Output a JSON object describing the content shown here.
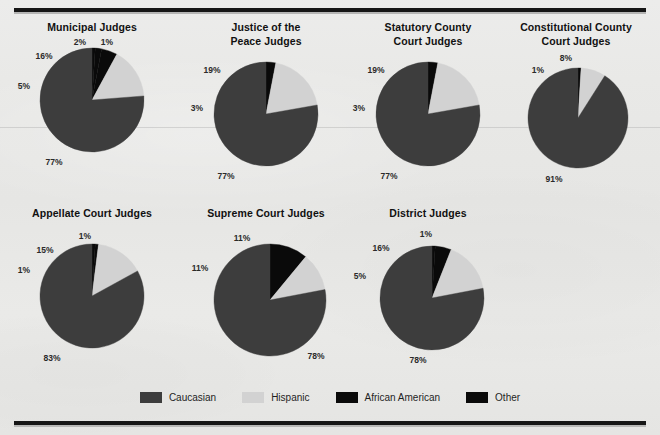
{
  "figure": {
    "background_color": "#e8e8e6",
    "rule_color": "#161616"
  },
  "legend": {
    "items": [
      {
        "label": "Caucasian",
        "color": "#3d3d3d"
      },
      {
        "label": "Hispanic",
        "color": "#d2d2d2"
      },
      {
        "label": "African American",
        "color": "#0a0a0a"
      },
      {
        "label": "Other",
        "color": "#0a0a0a"
      }
    ]
  },
  "chart_data": [
    {
      "type": "pie",
      "title": "Municipal Judges",
      "categories": [
        "Caucasian",
        "Hispanic",
        "African American",
        "Other"
      ],
      "values": [
        77,
        16,
        5,
        2
      ],
      "labels": [
        "77%",
        "16%",
        "5%",
        "2%",
        "1%"
      ],
      "colors": [
        "#3d3d3d",
        "#d2d2d2",
        "#0a0a0a",
        "#0a0a0a"
      ],
      "extra_slice": {
        "label": "1%",
        "value": 1,
        "category": "Other",
        "color": "#0a0a0a"
      }
    },
    {
      "type": "pie",
      "title": "Justice of the\nPeace Judges",
      "categories": [
        "Caucasian",
        "Hispanic",
        "African American"
      ],
      "values": [
        77,
        19,
        3
      ],
      "labels": [
        "77%",
        "19%",
        "3%"
      ],
      "colors": [
        "#3d3d3d",
        "#d2d2d2",
        "#0a0a0a"
      ]
    },
    {
      "type": "pie",
      "title": "Statutory County\nCourt Judges",
      "categories": [
        "Caucasian",
        "Hispanic",
        "African American"
      ],
      "values": [
        77,
        19,
        3
      ],
      "labels": [
        "77%",
        "19%",
        "3%"
      ],
      "colors": [
        "#3d3d3d",
        "#d2d2d2",
        "#0a0a0a"
      ]
    },
    {
      "type": "pie",
      "title": "Constitutional County\nCourt Judges",
      "categories": [
        "Caucasian",
        "Hispanic",
        "African American"
      ],
      "values": [
        91,
        8,
        1
      ],
      "labels": [
        "91%",
        "8%",
        "1%"
      ],
      "colors": [
        "#3d3d3d",
        "#d2d2d2",
        "#0a0a0a"
      ]
    },
    {
      "type": "pie",
      "title": "Appellate Court Judges",
      "categories": [
        "Caucasian",
        "Hispanic",
        "African American",
        "Other"
      ],
      "values": [
        83,
        15,
        1,
        1
      ],
      "labels": [
        "83%",
        "15%",
        "1%",
        "1%"
      ],
      "colors": [
        "#3d3d3d",
        "#d2d2d2",
        "#0a0a0a",
        "#0a0a0a"
      ]
    },
    {
      "type": "pie",
      "title": "Supreme Court Judges",
      "categories": [
        "Caucasian",
        "Hispanic",
        "African American"
      ],
      "values": [
        78,
        11,
        11
      ],
      "labels": [
        "78%",
        "11%",
        "11%"
      ],
      "colors": [
        "#3d3d3d",
        "#d2d2d2",
        "#0a0a0a"
      ]
    },
    {
      "type": "pie",
      "title": "District Judges",
      "categories": [
        "Caucasian",
        "Hispanic",
        "African American",
        "Other"
      ],
      "values": [
        78,
        16,
        5,
        1
      ],
      "labels": [
        "78%",
        "16%",
        "5%",
        "1%"
      ],
      "colors": [
        "#3d3d3d",
        "#d2d2d2",
        "#0a0a0a",
        "#0a0a0a"
      ]
    }
  ],
  "layout": {
    "charts": [
      {
        "left": 12,
        "top": 20,
        "r": 52,
        "cx": 80,
        "cy": 62,
        "label_pos": [
          {
            "t": "77%",
            "x": 42,
            "y": 124
          },
          {
            "t": "16%",
            "x": 32,
            "y": 18
          },
          {
            "t": "5%",
            "x": 12,
            "y": 48
          },
          {
            "t": "2%",
            "x": 68,
            "y": 4
          },
          {
            "t": "1%",
            "x": 95,
            "y": 4
          }
        ]
      },
      {
        "left": 186,
        "top": 20,
        "r": 52,
        "cx": 80,
        "cy": 62,
        "label_pos": [
          {
            "t": "77%",
            "x": 40,
            "y": 124
          },
          {
            "t": "19%",
            "x": 26,
            "y": 18
          },
          {
            "t": "3%",
            "x": 11,
            "y": 56
          }
        ]
      },
      {
        "left": 348,
        "top": 20,
        "r": 52,
        "cx": 80,
        "cy": 62,
        "label_pos": [
          {
            "t": "77%",
            "x": 41,
            "y": 124
          },
          {
            "t": "19%",
            "x": 28,
            "y": 18
          },
          {
            "t": "3%",
            "x": 11,
            "y": 56
          }
        ]
      },
      {
        "left": 496,
        "top": 20,
        "r": 50,
        "cx": 82,
        "cy": 66,
        "label_pos": [
          {
            "t": "91%",
            "x": 58,
            "y": 127
          },
          {
            "t": "8%",
            "x": 70,
            "y": 6
          },
          {
            "t": "1%",
            "x": 42,
            "y": 18
          }
        ]
      },
      {
        "left": 12,
        "top": 206,
        "r": 52,
        "cx": 80,
        "cy": 72,
        "label_pos": [
          {
            "t": "83%",
            "x": 40,
            "y": 134
          },
          {
            "t": "15%",
            "x": 33,
            "y": 26
          },
          {
            "t": "1%",
            "x": 12,
            "y": 46
          },
          {
            "t": "1%",
            "x": 73,
            "y": 12
          }
        ]
      },
      {
        "left": 186,
        "top": 206,
        "r": 56,
        "cx": 84,
        "cy": 76,
        "label_pos": [
          {
            "t": "78%",
            "x": 130,
            "y": 132
          },
          {
            "t": "11%",
            "x": 56,
            "y": 14
          },
          {
            "t": "11%",
            "x": 14,
            "y": 44
          }
        ]
      },
      {
        "left": 348,
        "top": 206,
        "r": 52,
        "cx": 84,
        "cy": 74,
        "label_pos": [
          {
            "t": "78%",
            "x": 70,
            "y": 136
          },
          {
            "t": "16%",
            "x": 33,
            "y": 24
          },
          {
            "t": "5%",
            "x": 12,
            "y": 52
          },
          {
            "t": "1%",
            "x": 78,
            "y": 10
          }
        ]
      }
    ]
  }
}
